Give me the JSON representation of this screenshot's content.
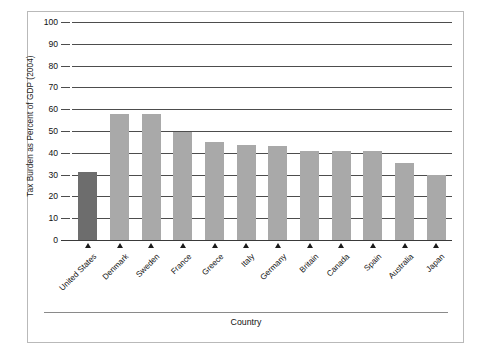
{
  "chart_data": {
    "type": "bar",
    "title": "",
    "subtitle": "",
    "xlabel": "Country",
    "ylabel": "Tax Burden as Percent of GDP (2004)",
    "categories": [
      "United States",
      "Denmark",
      "Sweden",
      "France",
      "Greece",
      "Italy",
      "Germany",
      "Britain",
      "Canada",
      "Spain",
      "Australia",
      "Japan"
    ],
    "values": [
      31,
      58,
      58,
      49.5,
      45,
      43.5,
      43,
      41,
      41,
      41,
      35.5,
      30
    ],
    "ylim": [
      0,
      100
    ],
    "yticks": [
      0,
      10,
      20,
      30,
      40,
      50,
      60,
      70,
      80,
      90,
      100
    ],
    "ytick_labels": [
      "0",
      "10",
      "20",
      "30",
      "40",
      "50",
      "60",
      "70",
      "80",
      "90",
      "100"
    ],
    "grid": true,
    "legend": false,
    "legend_position": "none",
    "highlight_category": "United States",
    "colors": {
      "bar": "#a9a9a9",
      "bar_highlight": "#6d6d6d",
      "gridline": "#4d4d4d",
      "axis": "#3a3a3a",
      "frame": "#b9b9b9",
      "text": "#111111"
    },
    "annotations": []
  }
}
